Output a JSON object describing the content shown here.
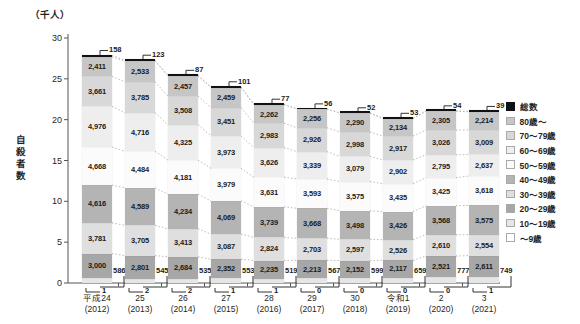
{
  "chart_data": {
    "type": "bar",
    "stacked": true,
    "unit_label": "（千人）",
    "ylabel": "自殺者数",
    "ylim": [
      0,
      30
    ],
    "yticks": [
      "0",
      "5",
      "10",
      "15",
      "20",
      "25",
      "30"
    ],
    "legend_position": "right",
    "grid": false,
    "categories": [
      {
        "era": "平成24",
        "western": "(2012)"
      },
      {
        "era": "25",
        "western": "(2013)"
      },
      {
        "era": "26",
        "western": "(2014)"
      },
      {
        "era": "27",
        "western": "(2015)"
      },
      {
        "era": "28",
        "western": "(2016)"
      },
      {
        "era": "29",
        "western": "(2017)"
      },
      {
        "era": "30",
        "western": "(2018)"
      },
      {
        "era": "令和1",
        "western": "(2019)"
      },
      {
        "era": "2",
        "western": "(2020)"
      },
      {
        "era": "3",
        "western": "(2021)"
      }
    ],
    "series": [
      {
        "name": "総数",
        "color": "#111111",
        "values": [
          158,
          123,
          87,
          101,
          77,
          56,
          52,
          53,
          54,
          39
        ]
      },
      {
        "name": "80歳～",
        "color": "#c6c6c6",
        "values": [
          2411,
          2533,
          2457,
          2459,
          2262,
          2256,
          2290,
          2134,
          2305,
          2214
        ]
      },
      {
        "name": "70～79歳",
        "color": "#d8d8d8",
        "values": [
          3661,
          3785,
          3508,
          3451,
          2983,
          2926,
          2998,
          2917,
          3026,
          3009
        ]
      },
      {
        "name": "60～69歳",
        "color": "#eeeeee",
        "values": [
          4976,
          4716,
          4325,
          3973,
          3626,
          3339,
          3079,
          2902,
          2795,
          2637
        ]
      },
      {
        "name": "50～59歳",
        "color": "#fbfbfb",
        "values": [
          4668,
          4484,
          4181,
          3979,
          3631,
          3593,
          3575,
          3435,
          3425,
          3618
        ]
      },
      {
        "name": "40～49歳",
        "color": "#b4b4b4",
        "values": [
          4616,
          4589,
          4234,
          4069,
          3739,
          3668,
          3498,
          3426,
          3568,
          3575
        ]
      },
      {
        "name": "30～39歳",
        "color": "#dfdfdf",
        "values": [
          3781,
          3705,
          3413,
          3087,
          2824,
          2703,
          2597,
          2526,
          2610,
          2554
        ]
      },
      {
        "name": "20～29歳",
        "color": "#a7a7a7",
        "values": [
          3000,
          2801,
          2684,
          2352,
          2235,
          2213,
          2152,
          2117,
          2521,
          2611
        ]
      },
      {
        "name": "10～19歳",
        "color": "#e6e6e6",
        "values": [
          586,
          545,
          535,
          553,
          519,
          567,
          599,
          659,
          777,
          749
        ]
      },
      {
        "name": "～9歳",
        "color": "#ffffff",
        "values": [
          1,
          2,
          2,
          1,
          1,
          0,
          0,
          0,
          0,
          1
        ]
      }
    ]
  }
}
